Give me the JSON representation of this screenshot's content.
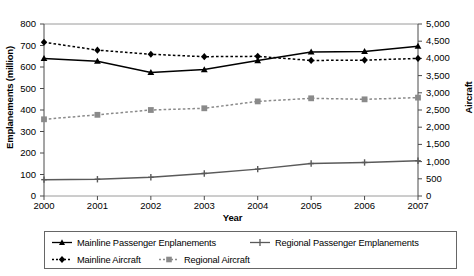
{
  "chart_data": {
    "type": "line",
    "title": "",
    "xlabel": "Year",
    "ylabel": "Emplanements (million)",
    "ylabel_secondary": "Aircraft",
    "grid": false,
    "legend_position": "bottom",
    "x": [
      2000,
      2001,
      2002,
      2003,
      2004,
      2005,
      2006,
      2007
    ],
    "categories": [
      "2000",
      "2001",
      "2002",
      "2003",
      "2004",
      "2005",
      "2006",
      "2007"
    ],
    "xlim": [
      2000,
      2007
    ],
    "ylim": [
      0,
      800
    ],
    "ylim_secondary": [
      0,
      5000
    ],
    "yticks": [
      0,
      100,
      200,
      300,
      400,
      500,
      600,
      700,
      800
    ],
    "ytick_labels": [
      "0",
      "100",
      "200",
      "300",
      "400",
      "500",
      "600",
      "700",
      "800"
    ],
    "yticks_secondary": [
      0,
      500,
      1000,
      1500,
      2000,
      2500,
      3000,
      3500,
      4000,
      4500,
      5000
    ],
    "ytick_labels_secondary": [
      "0",
      "500",
      "1,000",
      "1,500",
      "2,000",
      "2,500",
      "3,000",
      "3,500",
      "4,000",
      "4,500",
      "5,000"
    ],
    "series": [
      {
        "name": "Mainline Passenger Enplanements",
        "axis": "left",
        "style": "solid",
        "marker": "triangle",
        "color": "#000000",
        "values": [
          640,
          627,
          575,
          588,
          630,
          670,
          672,
          697
        ]
      },
      {
        "name": "Regional Passenger Emplanements",
        "axis": "left",
        "style": "solid",
        "marker": "plus",
        "color": "#5a5a5a",
        "values": [
          76,
          78,
          87,
          105,
          125,
          151,
          156,
          164
        ]
      },
      {
        "name": "Mainline Aircraft",
        "axis": "right",
        "style": "dotted",
        "marker": "diamond",
        "color": "#000000",
        "values": [
          4470,
          4240,
          4120,
          4050,
          4060,
          3940,
          3950,
          4000
        ]
      },
      {
        "name": "Regional Aircraft",
        "axis": "right",
        "style": "dotted",
        "marker": "square",
        "color": "#8a8a8a",
        "values": [
          2230,
          2360,
          2500,
          2550,
          2750,
          2840,
          2810,
          2860
        ]
      }
    ]
  },
  "legend": {
    "items": [
      {
        "label": "Mainline Passenger Enplanements"
      },
      {
        "label": "Regional Passenger Emplanements"
      },
      {
        "label": "Mainline Aircraft"
      },
      {
        "label": "Regional Aircraft"
      }
    ]
  }
}
